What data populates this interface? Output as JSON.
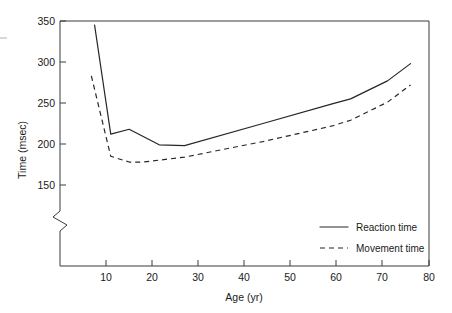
{
  "chart_data": {
    "type": "line",
    "title": "",
    "xlabel": "Age (yr)",
    "ylabel": "Time (msec)",
    "xlim": [
      0,
      80
    ],
    "ylim": [
      140,
      355
    ],
    "grid": false,
    "y_axis_break": true,
    "y_axis_break_note": "zigzag break on vertical axis below 150",
    "xticks": [
      10,
      20,
      30,
      40,
      50,
      60,
      70,
      80
    ],
    "xtick_labels": [
      "10",
      "20",
      "30",
      "40",
      "50",
      "60",
      "70",
      "80"
    ],
    "yticks": [
      150,
      200,
      250,
      300,
      350
    ],
    "ytick_labels": [
      "150",
      "200",
      "250",
      "300",
      "350"
    ],
    "legend_position": "lower right inside axes",
    "series": [
      {
        "name": "Reaction time",
        "style": "solid",
        "x": [
          7.5,
          11.0,
          15.0,
          21.5,
          27.0,
          44.0,
          59.0,
          63.0,
          71.0,
          76.0
        ],
        "y": [
          345,
          212,
          218,
          199,
          198,
          225,
          249,
          255,
          277,
          298
        ]
      },
      {
        "name": "Movement time",
        "style": "dashed",
        "x": [
          6.8,
          11.0,
          15.0,
          18.0,
          27.0,
          44.0,
          59.0,
          63.0,
          71.0,
          76.0
        ],
        "y": [
          283,
          185,
          178,
          178,
          184,
          203,
          222,
          229,
          251,
          272
        ]
      }
    ]
  },
  "axes": {
    "y_title": "Time (msec)",
    "x_title": "Age (yr)"
  },
  "legend": {
    "items": [
      {
        "label": "Reaction time",
        "style": "solid"
      },
      {
        "label": "Movement time",
        "style": "dashed"
      }
    ]
  }
}
